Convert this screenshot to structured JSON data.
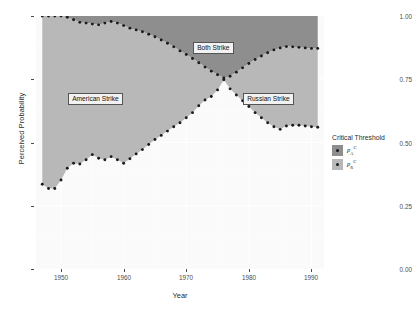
{
  "chart_data": {
    "type": "area",
    "title": "",
    "xlabel": "Year",
    "ylabel": "Perceived Probability",
    "xlim": [
      1946,
      1992
    ],
    "ylim": [
      0.0,
      1.0
    ],
    "grid": true,
    "x_ticks": [
      "1950",
      "1960",
      "1970",
      "1980",
      "1990"
    ],
    "x_tick_values": [
      1950,
      1960,
      1970,
      1980,
      1990
    ],
    "y_ticks": [
      "0.00",
      "0.25",
      "0.50",
      "0.75",
      "1.00"
    ],
    "y_tick_values": [
      0.0,
      0.25,
      0.5,
      0.75,
      1.0
    ],
    "legend_title": "Critical Threshold",
    "legend_position": "right",
    "series": [
      {
        "name": "p_A^C",
        "label_base": "p",
        "label_sub": "A",
        "label_sup": "C",
        "marker": "dot",
        "color": "#1a1a1a",
        "fill": "#8e8e8e",
        "x": [
          1947,
          1948,
          1949,
          1950,
          1951,
          1952,
          1953,
          1954,
          1955,
          1956,
          1957,
          1958,
          1959,
          1960,
          1961,
          1962,
          1963,
          1964,
          1965,
          1966,
          1967,
          1968,
          1969,
          1970,
          1971,
          1972,
          1973,
          1974,
          1975,
          1976,
          1977,
          1978,
          1979,
          1980,
          1981,
          1982,
          1983,
          1984,
          1985,
          1986,
          1987,
          1988,
          1989,
          1990,
          1991
        ],
        "y": [
          1.0,
          1.0,
          1.0,
          1.0,
          0.995,
          0.985,
          0.975,
          0.972,
          0.968,
          0.965,
          0.972,
          0.978,
          0.972,
          0.962,
          0.952,
          0.945,
          0.938,
          0.928,
          0.918,
          0.905,
          0.892,
          0.878,
          0.862,
          0.848,
          0.832,
          0.815,
          0.798,
          0.782,
          0.768,
          0.755,
          0.762,
          0.778,
          0.795,
          0.812,
          0.828,
          0.842,
          0.855,
          0.866,
          0.874,
          0.879,
          0.878,
          0.876,
          0.874,
          0.872,
          0.872
        ]
      },
      {
        "name": "p_R^C",
        "label_base": "p",
        "label_sub": "R",
        "label_sup": "C",
        "marker": "dot",
        "color": "#1a1a1a",
        "fill": "#b8b8b8",
        "x": [
          1947,
          1948,
          1949,
          1950,
          1951,
          1952,
          1953,
          1954,
          1955,
          1956,
          1957,
          1958,
          1959,
          1960,
          1961,
          1962,
          1963,
          1964,
          1965,
          1966,
          1967,
          1968,
          1969,
          1970,
          1971,
          1972,
          1973,
          1974,
          1975,
          1976,
          1977,
          1978,
          1979,
          1980,
          1981,
          1982,
          1983,
          1984,
          1985,
          1986,
          1987,
          1988,
          1989,
          1990,
          1991
        ],
        "y": [
          0.335,
          0.318,
          0.318,
          0.352,
          0.398,
          0.418,
          0.415,
          0.432,
          0.452,
          0.438,
          0.432,
          0.444,
          0.432,
          0.418,
          0.436,
          0.455,
          0.472,
          0.492,
          0.512,
          0.528,
          0.545,
          0.562,
          0.578,
          0.598,
          0.618,
          0.645,
          0.668,
          0.682,
          0.708,
          0.748,
          0.712,
          0.688,
          0.665,
          0.642,
          0.618,
          0.598,
          0.578,
          0.562,
          0.552,
          0.565,
          0.568,
          0.568,
          0.565,
          0.562,
          0.56
        ]
      }
    ],
    "regions": [
      {
        "name": "american-strike",
        "label": "American Strike",
        "color": "#b8b8b8"
      },
      {
        "name": "both-strike",
        "label": "Both Strike",
        "color": "#8e8e8e"
      },
      {
        "name": "russian-strike",
        "label": "Russian Strike",
        "color": "#b8b8b8"
      }
    ],
    "panel_background": "#fafafa",
    "grid_color": "#ffffff"
  }
}
